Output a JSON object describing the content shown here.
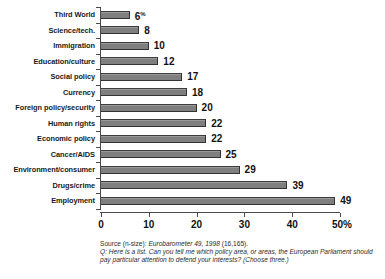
{
  "chart_data": {
    "type": "bar",
    "orientation": "horizontal",
    "title": "",
    "xlabel": "",
    "ylabel": "",
    "xlim": [
      0,
      50
    ],
    "grid": false,
    "legend": null,
    "unit": "%",
    "categories": [
      "Third World",
      "Science/tech.",
      "Immigration",
      "Education/culture",
      "Social policy",
      "Currency",
      "Foreign policy/security",
      "Human rights",
      "Economic policy",
      "Cancer/AIDS",
      "Environment/consumer",
      "Drugs/crime",
      "Employment"
    ],
    "values": [
      6,
      8,
      10,
      12,
      17,
      18,
      20,
      22,
      22,
      25,
      29,
      39,
      49
    ],
    "data_labels": [
      "6",
      "8",
      "10",
      "12",
      "17",
      "18",
      "20",
      "22",
      "22",
      "25",
      "29",
      "39",
      "49"
    ],
    "first_label_suffix": "%",
    "xticks": [
      0,
      10,
      20,
      30,
      40,
      50
    ],
    "xtick_labels": [
      "0",
      "10",
      "20",
      "30",
      "40",
      "50"
    ],
    "xtick_last_suffix": "%",
    "colors": {
      "bar_fill": "#7f7f7f",
      "bar_edge": "#333333",
      "axis": "#4a4a4a",
      "text": "#111111",
      "background": "#ffffff"
    }
  },
  "caption": {
    "source_prefix": "Source (n-size): ",
    "source_italic": "Eurobarometer 49, 1998",
    "source_suffix": " (16,165).",
    "question_prefix": "Q: ",
    "question_text": "Here is a list. Can you tell me which policy area, or areas, the European Parliament should pay particular attention to defend your interests? (Choose three.)"
  }
}
